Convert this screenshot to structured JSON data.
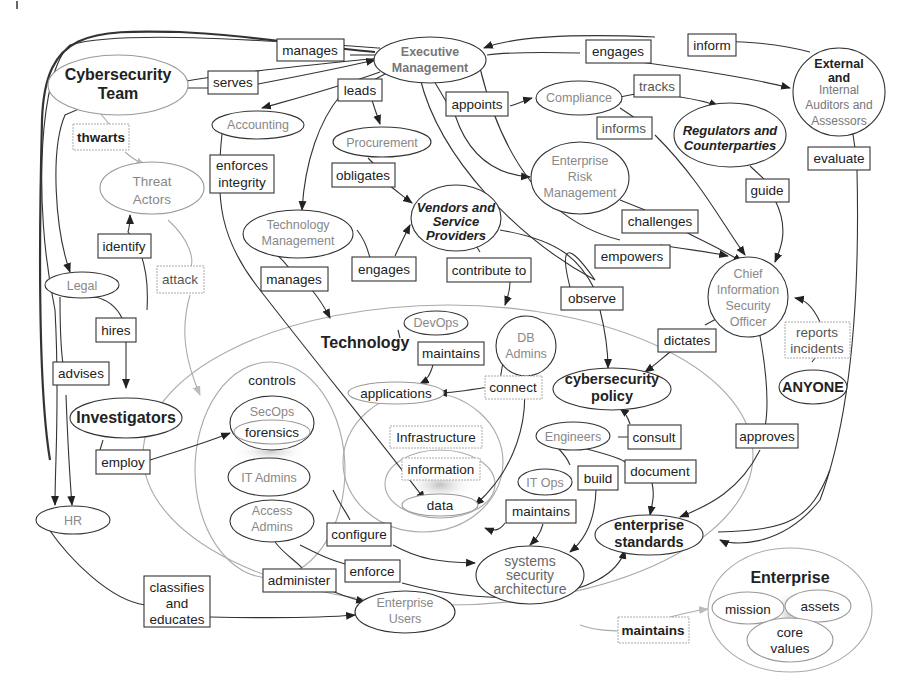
{
  "diagram": {
    "title": "",
    "nodes": {
      "cybersecurity_team": {
        "line1": "Cybersecurity",
        "line2": "Team"
      },
      "executive_management": {
        "line1": "Executive",
        "line2": "Management"
      },
      "external_auditors": {
        "line1": "External",
        "line2": "and",
        "line3": "Internal",
        "line4": "Auditors and",
        "line5": "Assessors"
      },
      "accounting": {
        "label": "Accounting"
      },
      "procurement": {
        "label": "Procurement"
      },
      "compliance": {
        "label": "Compliance"
      },
      "regulators": {
        "line1": "Regulators and",
        "line2": "Counterparties"
      },
      "erm": {
        "line1": "Enterprise",
        "line2": "Risk",
        "line3": "Management"
      },
      "threat_actors": {
        "line1": "Threat",
        "line2": "Actors"
      },
      "technology_management": {
        "line1": "Technology",
        "line2": "Management"
      },
      "vendors": {
        "line1": "Vendors and",
        "line2": "Service",
        "line3": "Providers"
      },
      "ciso": {
        "line1": "Chief",
        "line2": "Information",
        "line3": "Security",
        "line4": "Officer"
      },
      "legal": {
        "label": "Legal"
      },
      "investigators": {
        "label": "Investigators"
      },
      "hr": {
        "label": "HR"
      },
      "technology": {
        "label": "Technology"
      },
      "devops": {
        "label": "DevOps"
      },
      "db_admins": {
        "line1": "DB",
        "line2": "Admins"
      },
      "applications": {
        "label": "applications"
      },
      "cybersecurity_policy": {
        "line1": "cybersecurity",
        "line2": "policy"
      },
      "anyone": {
        "label": "ANYONE"
      },
      "controls": {
        "label": "controls"
      },
      "secops": {
        "label": "SecOps"
      },
      "forensics": {
        "label": "forensics"
      },
      "it_admins": {
        "label": "IT Admins"
      },
      "access_admins": {
        "line1": "Access",
        "line2": "Admins"
      },
      "infrastructure": {
        "label": "Infrastructure"
      },
      "information": {
        "label": "information"
      },
      "data": {
        "label": "data"
      },
      "engineers": {
        "label": "Engineers"
      },
      "it_ops": {
        "label": "IT Ops"
      },
      "enterprise_standards": {
        "line1": "enterprise",
        "line2": "standards"
      },
      "systems_security_architecture": {
        "line1": "systems",
        "line2": "security",
        "line3": "architecture"
      },
      "enterprise_users": {
        "line1": "Enterprise",
        "line2": "Users"
      },
      "enterprise": {
        "label": "Enterprise"
      },
      "mission": {
        "label": "mission"
      },
      "assets": {
        "label": "assets"
      },
      "core_values": {
        "line1": "core",
        "line2": "values"
      }
    },
    "edge_labels": {
      "manages_top": "manages",
      "serves": "serves",
      "engages_top": "engages",
      "inform": "inform",
      "leads": "leads",
      "appoints": "appoints",
      "tracks": "tracks",
      "thwarts": "thwarts",
      "informs": "informs",
      "enforces_integrity_1": "enforces",
      "enforces_integrity_2": "integrity",
      "obligates": "obligates",
      "evaluate": "evaluate",
      "guide": "guide",
      "challenges": "challenges",
      "identify": "identify",
      "attack": "attack",
      "manages_tech": "manages",
      "engages_vendors": "engages",
      "contribute_to": "contribute to",
      "empowers": "empowers",
      "observe": "observe",
      "hires": "hires",
      "advises": "advises",
      "maintains_devops": "maintains",
      "connect": "connect",
      "dictates": "dictates",
      "reports_incidents_1": "reports",
      "reports_incidents_2": "incidents",
      "employ": "employ",
      "consult": "consult",
      "build": "build",
      "document": "document",
      "approves": "approves",
      "maintains_itops": "maintains",
      "configure": "configure",
      "enforce": "enforce",
      "administer": "administer",
      "classifies_1": "classifies",
      "classifies_2": "and",
      "classifies_3": "educates",
      "maintains_enterprise": "maintains"
    }
  }
}
